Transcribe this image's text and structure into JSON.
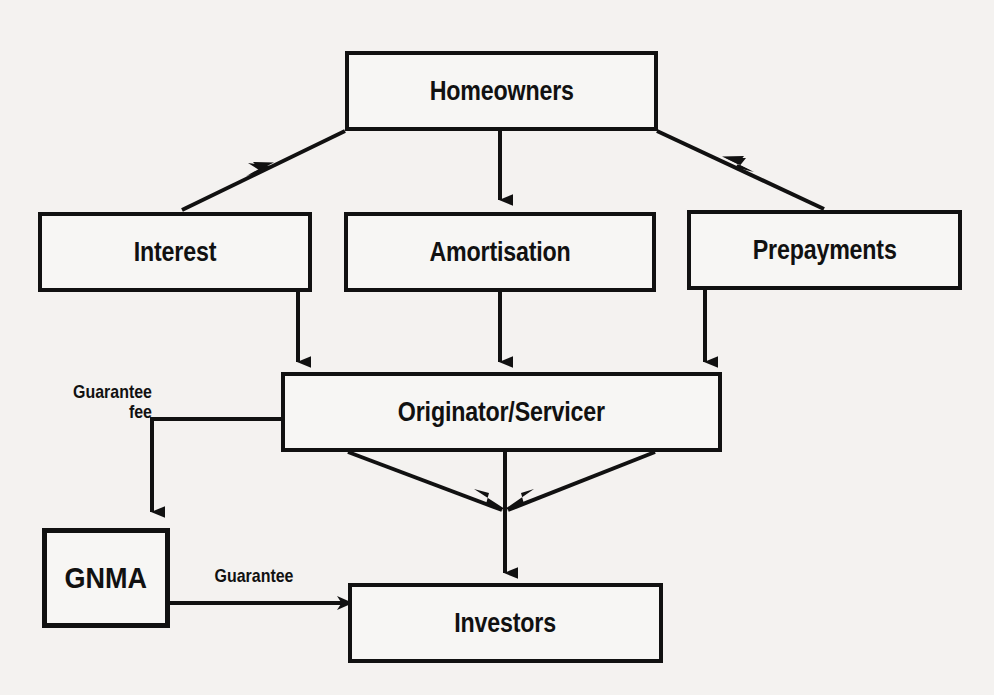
{
  "diagram": {
    "colors": {
      "background": "#f4f2f0",
      "stroke": "#111111",
      "box_fill": "#f7f6f4"
    },
    "nodes": [
      {
        "id": "homeowners",
        "label": "Homeowners",
        "x": 345,
        "y": 51,
        "w": 313,
        "h": 80,
        "emphasis": false
      },
      {
        "id": "interest",
        "label": "Interest",
        "x": 38,
        "y": 212,
        "w": 274,
        "h": 80,
        "emphasis": false
      },
      {
        "id": "amortisation",
        "label": "Amortisation",
        "x": 344,
        "y": 212,
        "w": 312,
        "h": 80,
        "emphasis": false
      },
      {
        "id": "prepayments",
        "label": "Prepayments",
        "x": 687,
        "y": 210,
        "w": 275,
        "h": 80,
        "emphasis": false
      },
      {
        "id": "originator",
        "label": "Originator/Servicer",
        "x": 281,
        "y": 372,
        "w": 441,
        "h": 80,
        "emphasis": false
      },
      {
        "id": "gnma",
        "label": "GNMA",
        "x": 42,
        "y": 528,
        "w": 128,
        "h": 100,
        "emphasis": true
      },
      {
        "id": "investors",
        "label": "Investors",
        "x": 348,
        "y": 583,
        "w": 315,
        "h": 80,
        "emphasis": false
      }
    ],
    "edge_labels": [
      {
        "id": "guarantee-fee",
        "text": "Guarantee\nfee",
        "x": 40,
        "y": 382,
        "w": 112,
        "align": "right"
      },
      {
        "id": "guarantee",
        "text": "Guarantee",
        "x": 204,
        "y": 566,
        "w": 100,
        "align": "center"
      }
    ],
    "edges": [
      {
        "id": "homeowners-to-interest",
        "from": "homeowners",
        "to": "interest",
        "kind": "diagonal"
      },
      {
        "id": "homeowners-to-amortisation",
        "from": "homeowners",
        "to": "amortisation",
        "kind": "vertical"
      },
      {
        "id": "homeowners-to-prepayments",
        "from": "homeowners",
        "to": "prepayments",
        "kind": "diagonal"
      },
      {
        "id": "interest-to-originator",
        "from": "interest",
        "to": "originator",
        "kind": "vertical"
      },
      {
        "id": "amortisation-to-originator",
        "from": "amortisation",
        "to": "originator",
        "kind": "vertical"
      },
      {
        "id": "prepayments-to-originator",
        "from": "prepayments",
        "to": "originator",
        "kind": "vertical"
      },
      {
        "id": "originator-to-gnma",
        "from": "originator",
        "to": "gnma",
        "kind": "elbow",
        "label": "Guarantee fee"
      },
      {
        "id": "originator-left-converge",
        "from": "originator",
        "to": "investors",
        "kind": "diagonal"
      },
      {
        "id": "originator-right-converge",
        "from": "originator",
        "to": "investors",
        "kind": "diagonal"
      },
      {
        "id": "originator-to-investors",
        "from": "originator",
        "to": "investors",
        "kind": "vertical"
      },
      {
        "id": "gnma-to-investors",
        "from": "gnma",
        "to": "investors",
        "kind": "horizontal",
        "label": "Guarantee"
      }
    ]
  }
}
